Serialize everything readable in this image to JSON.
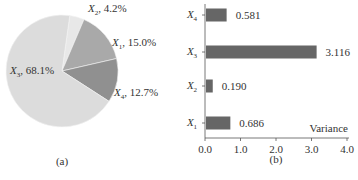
{
  "chart_data": [
    {
      "type": "pie",
      "caption": "(a)",
      "slices": [
        {
          "label": "X2",
          "sub": "2",
          "value": 4.2,
          "text": "4.2%",
          "color": "#e8e8e8"
        },
        {
          "label": "X1",
          "sub": "1",
          "value": 15.0,
          "text": "15.0%",
          "color": "#a9a9a9"
        },
        {
          "label": "X4",
          "sub": "4",
          "value": 12.7,
          "text": "12.7%",
          "color": "#909090"
        },
        {
          "label": "X3",
          "sub": "3",
          "value": 68.1,
          "text": "68.1%",
          "color": "#dcdcdc"
        }
      ]
    },
    {
      "type": "bar",
      "orientation": "horizontal",
      "caption": "(b)",
      "categories": [
        "X4",
        "X3",
        "X2",
        "X1"
      ],
      "subs": [
        "4",
        "3",
        "2",
        "1"
      ],
      "values": [
        0.581,
        3.116,
        0.19,
        0.686
      ],
      "value_labels": [
        "0.581",
        "3.116",
        "0.190",
        "0.686"
      ],
      "xlabel": "Variance",
      "xlim": [
        0,
        4.0
      ],
      "xticks": [
        "0.0",
        "1.0",
        "2.0",
        "3.0",
        "4.0"
      ],
      "bar_color": "#666666",
      "grid": false
    }
  ]
}
